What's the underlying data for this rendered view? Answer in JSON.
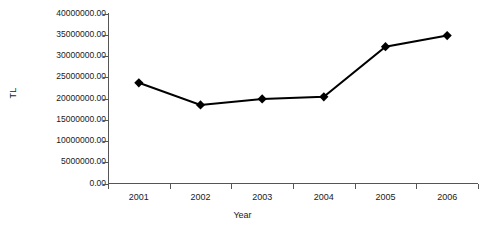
{
  "chart_data": {
    "type": "line",
    "title": "",
    "xlabel": "Year",
    "ylabel": "TL",
    "categories": [
      "2001",
      "2002",
      "2003",
      "2004",
      "2005",
      "2006"
    ],
    "values": [
      23700000.0,
      18500000.0,
      19900000.0,
      20400000.0,
      32200000.0,
      34800000.0
    ],
    "series": [
      {
        "name": "TL",
        "values": [
          23700000.0,
          18500000.0,
          19900000.0,
          20400000.0,
          32200000.0,
          34800000.0
        ]
      }
    ],
    "ylim": [
      0,
      40000000
    ],
    "y_ticks": [
      0,
      5000000,
      10000000,
      15000000,
      20000000,
      25000000,
      30000000,
      35000000,
      40000000
    ],
    "y_tick_labels": [
      "0.00",
      "5000000.00",
      "10000000.00",
      "15000000.00",
      "20000000.00",
      "25000000.00",
      "30000000.00",
      "35000000.00",
      "40000000.00"
    ],
    "x_tick_labels": [
      "2001",
      "2002",
      "2003",
      "2004",
      "2005",
      "2006"
    ],
    "grid": false,
    "legend": false,
    "legend_position": "none",
    "marker": "diamond",
    "line_color": "#000000",
    "marker_color": "#000000",
    "axis_color": "#555555",
    "background_color": "#ffffff"
  },
  "axes": {
    "y_title": "TL",
    "x_title": "Year"
  }
}
